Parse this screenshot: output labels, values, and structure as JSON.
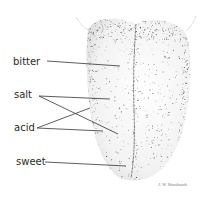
{
  "diagram": {
    "labels": [
      {
        "id": "bitter",
        "text": "bitter"
      },
      {
        "id": "salt",
        "text": "salt"
      },
      {
        "id": "acid",
        "text": "acid"
      },
      {
        "id": "sweet",
        "text": "sweet"
      }
    ],
    "signature": "J. W. Wendreath",
    "colors": {
      "ink": "#2a2a2a",
      "stipple": "#555555",
      "background": "#ffffff"
    }
  }
}
